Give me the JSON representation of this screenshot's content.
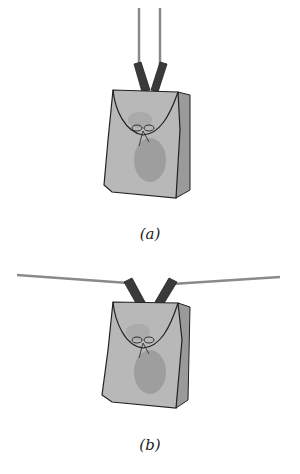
{
  "figure": {
    "panels": [
      {
        "id": "a",
        "caption": "(a)",
        "description": "Backpack hanging from two vertical ropes"
      },
      {
        "id": "b",
        "caption": "(b)",
        "description": "Backpack hanging from a nearly horizontal rope stretched between two points"
      }
    ]
  },
  "colors": {
    "rope": "#8a8a8a",
    "straps": "#3a3a3a",
    "bag_body": "#b8b8b8",
    "bag_side": "#9a9a9a",
    "bag_shadow": "#8c8c8c",
    "outline": "#222222"
  }
}
